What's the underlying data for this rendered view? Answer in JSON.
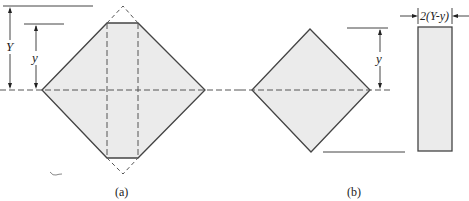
{
  "figure": {
    "panels": [
      {
        "id": "a",
        "caption": "(a)",
        "labels": {
          "big_height": "Y",
          "small_height": "y"
        },
        "description": "Square section rotated 45° with top and bottom corners truncated at distance y from the neutral axis; removed corners shown dashed; dashed vertical lines mark the central strip"
      },
      {
        "id": "b",
        "caption": "(b)",
        "labels": {
          "height": "y",
          "width": "2(Y-y)"
        },
        "description": "Decomposition: smaller rotated square of half-depth y and a rectangle of width 2(Y-y)"
      }
    ],
    "colors": {
      "fill": "#ebebeb",
      "stroke": "#444444",
      "background": "#ffffff"
    }
  }
}
